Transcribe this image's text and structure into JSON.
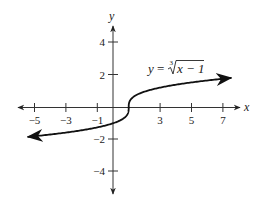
{
  "chart_data": {
    "type": "line",
    "title": "",
    "xlabel": "x",
    "ylabel": "y",
    "xlim": [
      -5.4,
      7.5
    ],
    "ylim": [
      -5,
      5
    ],
    "grid": false,
    "legend": null,
    "x_ticks": [
      -5,
      -3,
      -1,
      3,
      5,
      7
    ],
    "x_tick_labels": [
      "−5",
      "−3",
      "−1",
      "3",
      "5",
      "7"
    ],
    "y_ticks": [
      4,
      2,
      -2,
      -4
    ],
    "y_tick_labels": [
      "4",
      "2",
      "−2",
      "−4"
    ],
    "series": [
      {
        "name": "y = ∛(x − 1)",
        "function": "cbrt(x - 1)",
        "x": [
          -5.4,
          -5,
          -4,
          -3,
          -2,
          -1,
          0,
          0.5,
          0.9,
          1,
          1.1,
          1.5,
          2,
          3,
          4,
          5,
          6,
          7,
          7.5
        ],
        "values": [
          -1.857,
          -1.817,
          -1.71,
          -1.587,
          -1.442,
          -1.26,
          -1.0,
          -0.794,
          -0.464,
          0.0,
          0.464,
          0.794,
          1.0,
          1.26,
          1.442,
          1.587,
          1.71,
          1.817,
          1.866
        ],
        "arrows": "both-ends"
      }
    ],
    "annotations": [
      {
        "text": "y = ∛(x − 1)",
        "x": 2.3,
        "y": 2.3
      }
    ]
  },
  "labels": {
    "x_axis": "x",
    "y_axis": "y",
    "equation_y": "y",
    "equation_eq": " = ",
    "equation_index": "3",
    "equation_radicand": "x − 1",
    "xt0": "−5",
    "xt1": "−3",
    "xt2": "−1",
    "xt3": "3",
    "xt4": "5",
    "xt5": "7",
    "yt0": "4",
    "yt1": "2",
    "yt2": "−2",
    "yt3": "−4"
  }
}
